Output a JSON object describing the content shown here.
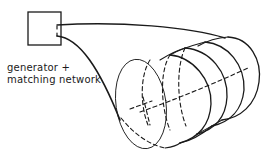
{
  "diagram": {
    "type": "schematic",
    "title": "",
    "labels": {
      "line1": "generator +",
      "line2": "matching network"
    },
    "elements": [
      {
        "name": "generator-box",
        "shape": "square"
      },
      {
        "name": "feed-wire-top",
        "shape": "curve"
      },
      {
        "name": "feed-wire-bottom",
        "shape": "curve"
      },
      {
        "name": "helical-coil",
        "shape": "coil",
        "turns": 5
      }
    ],
    "colors": {
      "stroke": "#1a1a1a",
      "background": "#ffffff"
    }
  }
}
